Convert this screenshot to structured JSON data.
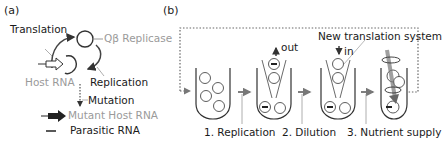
{
  "panel_a": {
    "label": "(a)",
    "translation": "Translation",
    "replicase": "Qβ Replicase",
    "host_rna": "Host RNA",
    "replication": "Replication",
    "mutation": "Mutation",
    "mutant_host_rna": "Mutant Host RNA",
    "parasitic_rna": "Parasitic RNA"
  },
  "panel_b": {
    "label": "(b)",
    "out": "out",
    "in": "in",
    "new_translation_system": "New translation system",
    "steps": [
      "1. Replication",
      "2. Dilution",
      "3. Nutrient supply"
    ]
  },
  "colors": {
    "line": "#333333",
    "gray_text": "#9a9a9a",
    "dotted": "#555555"
  }
}
